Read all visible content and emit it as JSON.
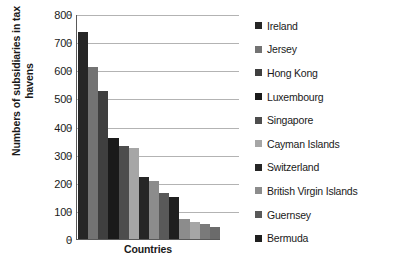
{
  "chart_data": {
    "type": "bar",
    "title": "",
    "xlabel": "Countries",
    "ylabel": "Numbers of subsidiaries in tax havens",
    "ylim": [
      0,
      800
    ],
    "ytick_step": 100,
    "yticks": [
      800,
      700,
      600,
      500,
      400,
      300,
      200,
      100,
      0
    ],
    "grid": true,
    "legend_position": "right",
    "categories": [
      "Ireland",
      "Jersey",
      "Hong Kong",
      "Luxembourg",
      "Singapore",
      "Cayman Islands",
      "Switzerland",
      "British Virgin Islands",
      "Guernsey",
      "Bermuda"
    ],
    "values": [
      735,
      610,
      525,
      358,
      330,
      323,
      222,
      205,
      165,
      148
    ],
    "extra_values": [
      72,
      62,
      52,
      42
    ],
    "bar_colors": [
      "#262626",
      "#737373",
      "#3f3f3f",
      "#1a1a1a",
      "#4d4d4d",
      "#a6a6a6",
      "#262626",
      "#8c8c8c",
      "#595959",
      "#1f1f1f"
    ],
    "series_name": "Subsidiaries"
  },
  "axis": {
    "ylabel": "Numbers of subsidiaries in tax havens",
    "xlabel": "Countries"
  },
  "legend": {
    "items": [
      {
        "label": "Ireland",
        "color": "#262626"
      },
      {
        "label": "Jersey",
        "color": "#737373"
      },
      {
        "label": "Hong Kong",
        "color": "#3f3f3f"
      },
      {
        "label": "Luxembourg",
        "color": "#1a1a1a"
      },
      {
        "label": "Singapore",
        "color": "#4d4d4d"
      },
      {
        "label": "Cayman Islands",
        "color": "#a6a6a6"
      },
      {
        "label": "Switzerland",
        "color": "#262626"
      },
      {
        "label": "British Virgin Islands",
        "color": "#8c8c8c"
      },
      {
        "label": "Guernsey",
        "color": "#595959"
      },
      {
        "label": "Bermuda",
        "color": "#1f1f1f"
      }
    ]
  },
  "style": {
    "gridline_color": "#b3b3b3",
    "axis_color": "#595959",
    "text_color": "#1a1a1a",
    "background": "#ffffff"
  }
}
